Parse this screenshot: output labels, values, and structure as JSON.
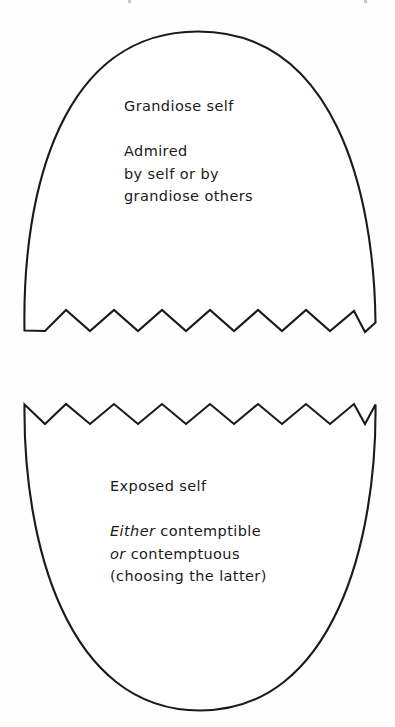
{
  "figure": {
    "name": "grandiose-and-exposed-self-diagram",
    "background_color": "#fefefe",
    "stroke_color": "#1a1a1a",
    "fill_color": "#ffffff"
  },
  "upper_shell": {
    "name": "grandiose-self-shell",
    "title": "Grandiose self",
    "body_lines": [
      "Admired",
      "by self or by",
      "grandiose  others"
    ]
  },
  "lower_shell": {
    "name": "exposed-self-shell",
    "title": "Exposed self",
    "body_lines": [
      {
        "emphasis": "Either",
        "rest": " contemptible"
      },
      {
        "emphasis": "or",
        "rest": " contemptuous"
      },
      {
        "emphasis": "",
        "rest": "(choosing  the  latter)"
      }
    ]
  },
  "geometry": {
    "upper_shell_path": "M 24.5 330.5 C 22 190 62 31.5 198 31.5 C 334 31.5 374 190 375.5 322.5 L 375.5 322.5 L 365 332 L 354 311 L 330 331 L 306 310 L 282 331 L 258 310 L 234 331 L 210 310 L 186 331 L 162 310 L 138 331 L 114 310 L 90 331 L 66 310 L 45 331 L 24.5 330.5 Z",
    "lower_shell_path": "M 24.5 404.5 L 45 424 L 66 404 L 90 424 L 114 404 L 138 424 L 162 404 L 186 424 L 210 404 L 234 424 L 258 404 L 282 424 L 306 404 L 330 424 L 354 404 L 365 424 L 375.5 404.5 C 377 540 334 710.5 200 710.5 C 66 710.5 23 540 24.5 404.5 Z"
  }
}
